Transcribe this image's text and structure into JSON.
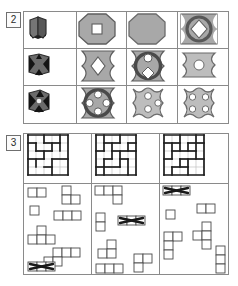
{
  "figure": {
    "background": "#ffffff",
    "line_color": "#8a8a8a",
    "ink_color": "#3a3a3a",
    "fill_gray": "#a8a8a8",
    "fill_gray_light": "#bdbdbd",
    "hole_white": "#ffffff"
  },
  "panels": [
    {
      "id": "panel-2",
      "label": "2",
      "type": "shape-matrix",
      "columns": 4,
      "rows": 3,
      "rows_data": [
        {
          "row_index": 1,
          "cells": [
            {
              "col": 1,
              "kind": "solid-3d-block",
              "name": "cube-icon",
              "description": "small dark 3d folded block",
              "fill": "#6e6e6e"
            },
            {
              "col": 2,
              "kind": "octagon",
              "name": "octagon-with-square-hole",
              "holes": [
                {
                  "shape": "square",
                  "count": 1
                }
              ],
              "fill": "#a8a8a8"
            },
            {
              "col": 3,
              "kind": "octagon",
              "name": "plain-octagon",
              "holes": [],
              "fill": "#a8a8a8"
            },
            {
              "col": 4,
              "kind": "concave-rect",
              "name": "concave-rect-ring-diamond",
              "holes": [
                {
                  "shape": "ring-diamond",
                  "count": 1
                }
              ],
              "fill": "#a8a8a8"
            }
          ]
        },
        {
          "row_index": 2,
          "cells": [
            {
              "col": 1,
              "kind": "solid-3d-block",
              "name": "notched-block-icon",
              "description": "small dark notched block",
              "fill": "#6e6e6e"
            },
            {
              "col": 2,
              "kind": "hourglass",
              "name": "hourglass-with-diamond-hole",
              "holes": [
                {
                  "shape": "diamond",
                  "count": 1
                }
              ],
              "fill": "#a8a8a8"
            },
            {
              "col": 3,
              "kind": "hourglass",
              "name": "hourglass-ring-two-circles-diamond",
              "holes": [
                {
                  "shape": "ring-circle-diamond",
                  "count": 1
                }
              ],
              "fill": "#a8a8a8"
            },
            {
              "col": 4,
              "kind": "concave-rect",
              "name": "concave-rect-circle-hole",
              "holes": [
                {
                  "shape": "circle",
                  "count": 1
                }
              ],
              "fill": "#bdbdbd"
            }
          ]
        },
        {
          "row_index": 3,
          "cells": [
            {
              "col": 1,
              "kind": "solid-3d-block",
              "name": "starred-block-icon",
              "description": "small dark block with notches",
              "fill": "#6e6e6e"
            },
            {
              "col": 2,
              "kind": "hourglass",
              "name": "hourglass-ring-four-circles",
              "holes": [
                {
                  "shape": "circle",
                  "count": 4
                }
              ],
              "fill": "#a8a8a8"
            },
            {
              "col": 3,
              "kind": "cross-lobed",
              "name": "lobed-shape-three-circles",
              "holes": [
                {
                  "shape": "circle",
                  "count": 3
                }
              ],
              "fill": "#bdbdbd"
            },
            {
              "col": 4,
              "kind": "cross-lobed",
              "name": "lobed-shape-four-circles",
              "holes": [
                {
                  "shape": "circle",
                  "count": 4
                }
              ],
              "fill": "#bdbdbd"
            }
          ]
        }
      ]
    },
    {
      "id": "panel-3",
      "label": "3",
      "type": "polyomino-puzzle",
      "columns": 3,
      "grids": [
        {
          "name": "puzzle-grid-1",
          "size": 5,
          "thick_segments": {
            "horizontal": [
              [
                0,
                0,
                5
              ],
              [
                1,
                0,
                1
              ],
              [
                1,
                2,
                4
              ],
              [
                2,
                1,
                3
              ],
              [
                3,
                0,
                2
              ],
              [
                3,
                3,
                5
              ],
              [
                4,
                2,
                3
              ],
              [
                5,
                0,
                5
              ]
            ],
            "vertical": [
              [
                0,
                0,
                5
              ],
              [
                1,
                1,
                2
              ],
              [
                1,
                3,
                4
              ],
              [
                2,
                0,
                1
              ],
              [
                2,
                2,
                3
              ],
              [
                3,
                1,
                2
              ],
              [
                3,
                3,
                5
              ],
              [
                4,
                0,
                2
              ],
              [
                5,
                0,
                5
              ]
            ]
          }
        },
        {
          "name": "puzzle-grid-2",
          "size": 5,
          "thick_segments": {
            "horizontal": [
              [
                0,
                0,
                5
              ],
              [
                1,
                1,
                3
              ],
              [
                1,
                4,
                5
              ],
              [
                2,
                0,
                1
              ],
              [
                2,
                2,
                5
              ],
              [
                3,
                1,
                2
              ],
              [
                3,
                3,
                4
              ],
              [
                4,
                0,
                3
              ],
              [
                5,
                0,
                5
              ]
            ],
            "vertical": [
              [
                0,
                0,
                5
              ],
              [
                1,
                0,
                2
              ],
              [
                1,
                3,
                5
              ],
              [
                2,
                1,
                3
              ],
              [
                3,
                0,
                1
              ],
              [
                3,
                2,
                4
              ],
              [
                4,
                1,
                2
              ],
              [
                4,
                3,
                5
              ],
              [
                5,
                0,
                5
              ]
            ]
          }
        },
        {
          "name": "puzzle-grid-3",
          "size": 5,
          "thick_segments": {
            "horizontal": [
              [
                0,
                0,
                5
              ],
              [
                1,
                0,
                2
              ],
              [
                1,
                3,
                5
              ],
              [
                2,
                1,
                4
              ],
              [
                3,
                0,
                1
              ],
              [
                3,
                2,
                5
              ],
              [
                4,
                1,
                3
              ],
              [
                5,
                0,
                5
              ]
            ],
            "vertical": [
              [
                0,
                0,
                5
              ],
              [
                1,
                1,
                3
              ],
              [
                1,
                4,
                5
              ],
              [
                2,
                0,
                2
              ],
              [
                2,
                3,
                4
              ],
              [
                3,
                1,
                2
              ],
              [
                3,
                3,
                5
              ],
              [
                4,
                0,
                3
              ],
              [
                5,
                0,
                5
              ]
            ]
          }
        }
      ],
      "piece_groups": [
        {
          "name": "piece-tray-1",
          "pieces": [
            {
              "name": "piece-domino-h",
              "cells": [
                [
                  0,
                  0
                ],
                [
                  1,
                  0
                ]
              ],
              "x": 4,
              "y": 4,
              "crossed": false
            },
            {
              "name": "piece-l-tromino",
              "cells": [
                [
                  0,
                  0
                ],
                [
                  0,
                  1
                ],
                [
                  1,
                  1
                ]
              ],
              "x": 38,
              "y": 2,
              "crossed": false
            },
            {
              "name": "piece-monomino",
              "cells": [
                [
                  0,
                  0
                ]
              ],
              "x": 6,
              "y": 22,
              "crossed": false
            },
            {
              "name": "piece-i-tromino-h",
              "cells": [
                [
                  0,
                  0
                ],
                [
                  1,
                  0
                ],
                [
                  2,
                  0
                ]
              ],
              "x": 30,
              "y": 27,
              "crossed": false
            },
            {
              "name": "piece-t-tetromino",
              "cells": [
                [
                  1,
                  0
                ],
                [
                  0,
                  1
                ],
                [
                  1,
                  1
                ],
                [
                  2,
                  1
                ]
              ],
              "x": 4,
              "y": 42,
              "crossed": false
            },
            {
              "name": "piece-l-tetromino",
              "cells": [
                [
                  1,
                  0
                ],
                [
                  2,
                  0
                ],
                [
                  3,
                  0
                ],
                [
                  0,
                  1
                ],
                [
                  1,
                  1
                ]
              ],
              "x": 20,
              "y": 64,
              "crossed": false
            },
            {
              "name": "piece-crossed-tetromino",
              "cells": [
                [
                  0,
                  0
                ],
                [
                  1,
                  0
                ],
                [
                  2,
                  0
                ]
              ],
              "x": 4,
              "y": 78,
              "crossed": true
            }
          ]
        },
        {
          "name": "piece-tray-2",
          "pieces": [
            {
              "name": "piece-l-tetromino-a",
              "cells": [
                [
                  0,
                  0
                ],
                [
                  1,
                  0
                ],
                [
                  2,
                  0
                ],
                [
                  2,
                  1
                ]
              ],
              "x": 3,
              "y": 2,
              "crossed": false
            },
            {
              "name": "piece-domino-v",
              "cells": [
                [
                  0,
                  0
                ],
                [
                  0,
                  1
                ]
              ],
              "x": 4,
              "y": 29,
              "crossed": false
            },
            {
              "name": "piece-crossed-plus",
              "cells": [
                [
                  0,
                  0
                ],
                [
                  1,
                  0
                ],
                [
                  2,
                  0
                ]
              ],
              "x": 26,
              "y": 32,
              "crossed": true
            },
            {
              "name": "piece-s-tetromino",
              "cells": [
                [
                  1,
                  0
                ],
                [
                  0,
                  1
                ],
                [
                  1,
                  1
                ]
              ],
              "x": 6,
              "y": 56,
              "crossed": false
            },
            {
              "name": "piece-i-tetromino",
              "cells": [
                [
                  0,
                  0
                ],
                [
                  1,
                  0
                ],
                [
                  2,
                  0
                ]
              ],
              "x": 4,
              "y": 80,
              "crossed": false
            },
            {
              "name": "piece-p-tetromino",
              "cells": [
                [
                  0,
                  0
                ],
                [
                  1,
                  0
                ],
                [
                  0,
                  1
                ]
              ],
              "x": 42,
              "y": 70,
              "crossed": false
            }
          ]
        },
        {
          "name": "piece-tray-3",
          "pieces": [
            {
              "name": "piece-crossed-i-tromino",
              "cells": [
                [
                  0,
                  0
                ],
                [
                  1,
                  0
                ],
                [
                  2,
                  0
                ]
              ],
              "x": 3,
              "y": 2,
              "crossed": true
            },
            {
              "name": "piece-monomino",
              "cells": [
                [
                  0,
                  0
                ]
              ],
              "x": 6,
              "y": 26,
              "crossed": false
            },
            {
              "name": "piece-domino-h",
              "cells": [
                [
                  0,
                  0
                ],
                [
                  1,
                  0
                ]
              ],
              "x": 37,
              "y": 20,
              "crossed": false
            },
            {
              "name": "piece-t-tetromino",
              "cells": [
                [
                  1,
                  0
                ],
                [
                  0,
                  1
                ],
                [
                  1,
                  1
                ],
                [
                  1,
                  2
                ]
              ],
              "x": 33,
              "y": 38,
              "crossed": false
            },
            {
              "name": "piece-l-pentomino",
              "cells": [
                [
                  0,
                  0
                ],
                [
                  1,
                  0
                ],
                [
                  0,
                  1
                ],
                [
                  0,
                  2
                ]
              ],
              "x": 4,
              "y": 48,
              "crossed": false
            },
            {
              "name": "piece-i-tromino-v",
              "cells": [
                [
                  0,
                  0
                ],
                [
                  0,
                  1
                ],
                [
                  0,
                  2
                ]
              ],
              "x": 56,
              "y": 62,
              "crossed": false
            }
          ]
        }
      ]
    }
  ]
}
